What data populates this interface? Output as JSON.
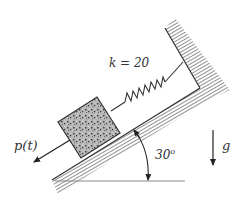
{
  "diagram": {
    "type": "mechanics-free-body",
    "labels": {
      "spring_constant": "k = 20",
      "force": "p(t)",
      "angle": "30",
      "angle_unit": "o",
      "gravity": "g"
    },
    "colors": {
      "line": "#333333",
      "hatch": "#555555",
      "block_fill": "#9a9a9a",
      "ground_line": "#8a8a8a"
    }
  }
}
